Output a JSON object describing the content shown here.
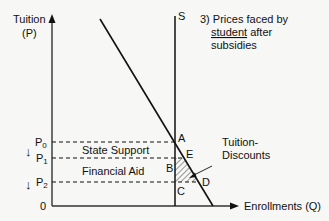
{
  "axes": {
    "y_label_line1": "Tuition",
    "y_label_line2": "(P)",
    "x_label": "Enrollments (Q)",
    "origin": "0"
  },
  "curves": {
    "supply_label": "S"
  },
  "annotation": {
    "line1_prefix": "3) Prices faced by",
    "line2_underlined": "student",
    "line2_rest": " after",
    "line3": "subsidies"
  },
  "prices": [
    {
      "base": "P",
      "sub": "0"
    },
    {
      "base": "P",
      "sub": "1"
    },
    {
      "base": "P",
      "sub": "2"
    }
  ],
  "regions": {
    "state_support": "State Support",
    "financial_aid": "Financial Aid",
    "tuition_discounts_line1": "Tuition-",
    "tuition_discounts_line2": "Discounts"
  },
  "points": {
    "A": "A",
    "B": "B",
    "C": "C",
    "D": "D",
    "E": "E"
  },
  "arrows": {
    "down1": "↓",
    "down2": "↓"
  },
  "colors": {
    "line": "#111111",
    "axis": "#333333",
    "background": "#f7f7f5"
  }
}
